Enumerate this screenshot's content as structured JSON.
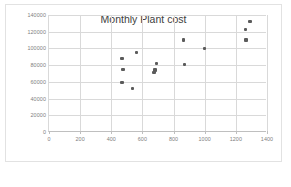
{
  "chart_data": {
    "type": "scatter",
    "title": "Monthly Plant cost",
    "xlabel": "",
    "ylabel": "",
    "xlim": [
      0,
      1400
    ],
    "ylim": [
      0,
      140000
    ],
    "xticks": [
      0,
      200,
      400,
      600,
      800,
      1000,
      1200,
      1400
    ],
    "yticks": [
      0,
      20000,
      40000,
      60000,
      80000,
      100000,
      120000,
      140000
    ],
    "xtick_labels": [
      "0",
      "200",
      "400",
      "600",
      "800",
      "1000",
      "1200",
      "1400"
    ],
    "ytick_labels": [
      "0",
      "20000",
      "40000",
      "60000",
      "80000",
      "100000",
      "120000",
      "140000"
    ],
    "grid": true,
    "legend": false,
    "marker_color": "#5b5b5b",
    "gridline_color": "#d9d9d9",
    "series": [
      {
        "name": "Monthly Plant cost",
        "points": [
          {
            "x": 470,
            "y": 88000
          },
          {
            "x": 475,
            "y": 75000
          },
          {
            "x": 470,
            "y": 59000
          },
          {
            "x": 535,
            "y": 52000
          },
          {
            "x": 560,
            "y": 95000
          },
          {
            "x": 675,
            "y": 71000
          },
          {
            "x": 680,
            "y": 74000
          },
          {
            "x": 690,
            "y": 82000
          },
          {
            "x": 865,
            "y": 110000
          },
          {
            "x": 870,
            "y": 81000
          },
          {
            "x": 1000,
            "y": 100000
          },
          {
            "x": 1260,
            "y": 123000
          },
          {
            "x": 1265,
            "y": 110000
          },
          {
            "x": 1290,
            "y": 132000
          }
        ]
      }
    ]
  }
}
